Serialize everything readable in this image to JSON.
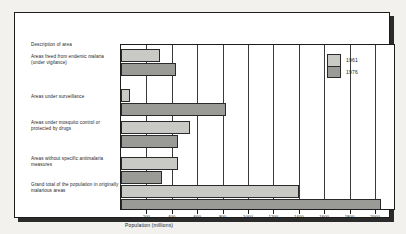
{
  "chart_data": {
    "type": "bar",
    "orientation": "horizontal",
    "title": "",
    "xlabel": "Population (millions)",
    "ylabel": "Description of area",
    "xlim": [
      0,
      2150
    ],
    "grid": true,
    "legend_position": "top-right",
    "xticks": [
      200,
      400,
      600,
      800,
      1000,
      1200,
      1400,
      1600,
      1800,
      2000
    ],
    "categories": [
      "Areas freed from endemic malaria (under vigilance)",
      "Areas under surveillance",
      "Areas under mosquito control or protected by drugs",
      "Areas without specific antimalaria measures",
      "Grand total of the population in originally malarious areas"
    ],
    "series": [
      {
        "name": "1961",
        "color": "#c9c9c6",
        "values": [
          310,
          70,
          540,
          450,
          1400
        ]
      },
      {
        "name": "1976",
        "color": "#9a9a97",
        "values": [
          430,
          830,
          450,
          320,
          2050
        ]
      }
    ]
  },
  "header": {
    "column_label": "Description of area"
  },
  "legend": {
    "entries": [
      {
        "label": "1961"
      },
      {
        "label": "1976"
      }
    ]
  },
  "axis": {
    "title": "Population (millions)",
    "ticks": [
      "200",
      "400",
      "600",
      "800",
      "1000",
      "1200",
      "1400",
      "1600",
      "1800",
      "2000"
    ]
  },
  "rows": [
    {
      "label": "Areas freed from endemic malaria (under vigilance)"
    },
    {
      "label": "Areas under surveillance"
    },
    {
      "label": "Areas under mosquito control or protected by drugs"
    },
    {
      "label": "Areas without specific antimalaria measures"
    },
    {
      "label": "Grand total of the population in originally malarious areas"
    }
  ]
}
